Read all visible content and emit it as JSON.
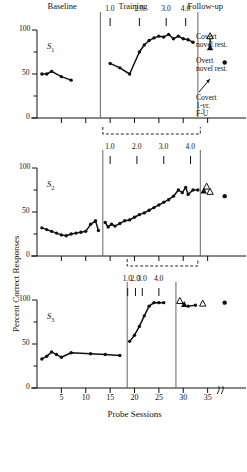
{
  "figure": {
    "xlabel": "Probe Sessions",
    "ylabel": "Percent Correct Responses",
    "phase_headers": [
      {
        "label": "Baseline",
        "x": 62
      },
      {
        "label": "Training",
        "x": 133
      },
      {
        "label": "Follow-up",
        "x": 205
      }
    ],
    "legend": [
      {
        "marker": "open-triangle",
        "line1": "Covert",
        "line2": "novel rest."
      },
      {
        "marker": "filled-triangle",
        "line1": "Overt",
        "line2": "novel rest."
      },
      {
        "marker": "filled-dot",
        "line1": "Covert",
        "line2": "1-yr.",
        "line3": "F-U"
      }
    ]
  },
  "chart_data": {
    "type": "line",
    "title": "",
    "xlabel": "Probe Sessions",
    "ylabel": "Percent Correct Responses",
    "xlim": [
      0,
      40
    ],
    "ylim": [
      0,
      100
    ],
    "yticks": [
      0,
      50,
      100
    ],
    "yminorticks": [
      25,
      75
    ],
    "xticks": [
      5,
      10,
      15,
      20,
      25,
      30,
      35
    ],
    "grid": false,
    "axis_break_after": 35,
    "legend_position": "right",
    "panels": [
      {
        "name": "S1",
        "subject_label": "S",
        "subject_sub": "1",
        "training_ticks": [
          {
            "label": "1.0",
            "x": 15.0
          },
          {
            "label": "2.0",
            "x": 21.0
          },
          {
            "label": "3.0",
            "x": 26.5
          },
          {
            "label": "4.0",
            "x": 30.5
          }
        ],
        "phase_dividers": [
          13.0,
          33.0
        ],
        "baseline": {
          "x": [
            1,
            2,
            3,
            5,
            7
          ],
          "y": [
            50,
            50,
            53,
            47,
            43
          ]
        },
        "training": {
          "x": [
            15,
            17,
            19,
            21,
            22,
            23,
            24,
            25,
            26,
            27,
            28,
            29,
            30,
            31,
            32
          ],
          "y": [
            62,
            57,
            50,
            75,
            83,
            88,
            91,
            93,
            92,
            95,
            90,
            93,
            90,
            89,
            86
          ]
        },
        "followup": {
          "covert_novel": {
            "x": 35.5,
            "y": 93
          },
          "overt_novel": {
            "x": 35.5,
            "y": 80
          }
        },
        "covert_1yr": {
          "x": 38.5,
          "y": 63
        }
      },
      {
        "name": "S2",
        "subject_label": "S",
        "subject_sub": "2",
        "training_ticks": [
          {
            "label": "1.0",
            "x": 15.0
          },
          {
            "label": "2.0",
            "x": 20.5
          },
          {
            "label": "3.0",
            "x": 26.0
          },
          {
            "label": "4.0",
            "x": 31.5
          }
        ],
        "phase_dividers": [
          13.5,
          33.5
        ],
        "bracket": {
          "from": 13.5,
          "to": 33.5
        },
        "baseline": {
          "x": [
            1,
            2,
            3,
            4,
            5,
            6,
            7,
            8,
            9,
            10,
            11,
            12,
            12.6
          ],
          "y": [
            32,
            30,
            28,
            26,
            24,
            23,
            25,
            26,
            27,
            28,
            36,
            40,
            29
          ]
        },
        "training": {
          "x": [
            14,
            14.6,
            15.3,
            16,
            17,
            18,
            19,
            20,
            21,
            22,
            23,
            24,
            25,
            26,
            27,
            28,
            29,
            29.8,
            30.5,
            31,
            32,
            33
          ],
          "y": [
            38,
            33,
            36,
            34,
            37,
            40,
            41,
            44,
            47,
            49,
            52,
            55,
            58,
            61,
            64,
            68,
            75,
            72,
            78,
            70,
            75,
            75
          ]
        },
        "followup": {
          "covert_novel": {
            "x": 34.8,
            "y": 79
          },
          "overt_novel": {
            "x": 34.2,
            "y": 74
          },
          "open_triangle": {
            "x": 35.5,
            "y": 73
          }
        },
        "covert_1yr": {
          "x": 38.5,
          "y": 68
        }
      },
      {
        "name": "S3",
        "subject_label": "S",
        "subject_sub": "3",
        "training_ticks": [
          {
            "label": "1.0",
            "x": 18.6
          },
          {
            "label": "2.0",
            "x": 20.2
          },
          {
            "label": "3.0",
            "x": 21.6
          },
          {
            "label": "4.0",
            "x": 25.0
          }
        ],
        "phase_dividers": [
          18.5,
          28.5
        ],
        "bracket": {
          "from": 18.5,
          "to": 33.0
        },
        "baseline": {
          "x": [
            1,
            2,
            3,
            4,
            5,
            7,
            11,
            14,
            17
          ],
          "y": [
            33,
            36,
            41,
            38,
            35,
            40,
            39,
            38,
            37
          ]
        },
        "training": {
          "x": [
            19,
            20,
            21,
            22,
            23,
            24,
            25,
            26
          ],
          "y": [
            53,
            60,
            70,
            82,
            93,
            97,
            97,
            97
          ]
        },
        "followup": {
          "covert_novel": {
            "x": 29.3,
            "y": 99
          },
          "overt_novel": {
            "x": 30.2,
            "y": 95
          },
          "mid_points": {
            "x": [
              31,
              32.5
            ],
            "y": [
              93,
              94
            ]
          },
          "open_triangle": {
            "x": 34.0,
            "y": 96
          }
        },
        "covert_1yr": {
          "x": 38.5,
          "y": 97
        }
      }
    ]
  }
}
